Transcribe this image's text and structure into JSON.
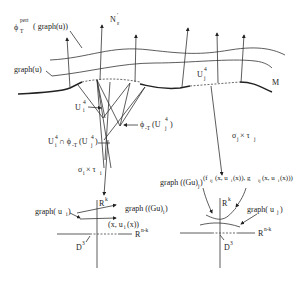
{
  "labels": {
    "phi_pert_graph": {
      "phi": "ϕ",
      "sup": "pert",
      "sub": "T",
      "arg": "( graph(u))"
    },
    "normal_bundle": {
      "base": "N",
      "sub": "ε",
      "prime": "′"
    },
    "graph_u": "graph(u)",
    "M": "M",
    "U_i_left": {
      "base": "U",
      "bar": "‾",
      "sub": "i",
      "sup": "4"
    },
    "U_j_right": {
      "base": "U",
      "sub": "j",
      "sup": "4"
    },
    "phi_T_Uj": {
      "text": "ϕ",
      "sub": "-T",
      "arg": "(U",
      "argsub": "j",
      "argsup": "4",
      "close": ")"
    },
    "intersection": {
      "text": "U",
      "sub": "i",
      "sup": "4",
      "mid": " ∩ ϕ",
      "midsub": "-T",
      "arg": "(U",
      "argsub": "j",
      "argsup": "4",
      "close": ")"
    },
    "sigma_i_tau_i": {
      "sigma": "σ",
      "sub1": "i",
      "times": " × τ",
      "sub2": "i"
    },
    "sigma_j_tau_j": {
      "sigma": "σ",
      "sub1": "j",
      "times": " × τ",
      "sub2": "j"
    }
  },
  "left_panel": {
    "Rk": {
      "base": "R",
      "sup": "k"
    },
    "Rnk": {
      "base": "R",
      "sup": "n-k"
    },
    "D3": {
      "base": "D",
      "sup": "3"
    },
    "graph_ui": {
      "text": "graph( u",
      "sub": "i",
      "close": ")"
    },
    "graph_Gui": {
      "text": "graph ((Gu)",
      "sub": "i",
      "close": ")"
    },
    "point": {
      "text": "(x, u",
      "sub": "i",
      "close": "(x))"
    }
  },
  "right_panel": {
    "Rk": {
      "base": "R",
      "sup": "k"
    },
    "Rnk": {
      "base": "R",
      "sup": "n-k"
    },
    "D3": {
      "base": "D",
      "sup": "3"
    },
    "graph_Guj": {
      "text": "graph ((Gu)",
      "sub": "j",
      "close": ")"
    },
    "graph_uj": {
      "text": "graph( u",
      "sub": "j",
      "close": ")"
    },
    "fg": {
      "t1": "(f",
      "s1": "ij",
      "t2": "(x, u",
      "s2": "i",
      "t3": "(x)), g",
      "s3": "ij",
      "t4": "(x, u",
      "s4": "i",
      "t5": "(x)))"
    }
  }
}
